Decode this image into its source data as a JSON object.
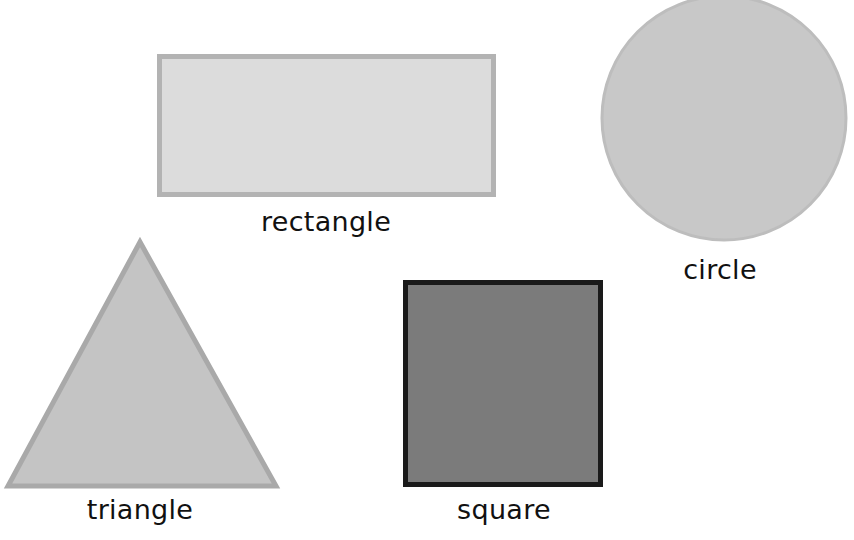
{
  "shapes": [
    {
      "id": "rectangle",
      "label": "rectangle",
      "fill": "#dcdcdc",
      "stroke": "#b3b3b3"
    },
    {
      "id": "circle",
      "label": "circle",
      "fill": "#c8c8c8",
      "stroke": "#bdbdbd"
    },
    {
      "id": "triangle",
      "label": "triangle",
      "fill": "#c4c4c4",
      "stroke": "#a9a9a9"
    },
    {
      "id": "square",
      "label": "square",
      "fill": "#7b7b7b",
      "stroke": "#1a1a1a"
    }
  ]
}
